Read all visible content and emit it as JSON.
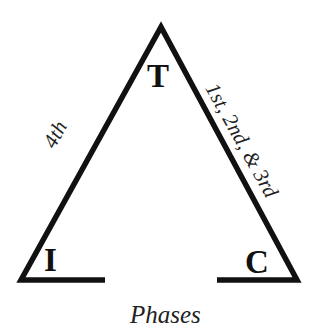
{
  "diagram": {
    "type": "triangle",
    "stroke_color": "#111111",
    "vertices": [
      {
        "id": "top",
        "label": "T"
      },
      {
        "id": "bottom-left",
        "label": "I"
      },
      {
        "id": "bottom-right",
        "label": "C"
      }
    ],
    "edges": [
      {
        "from": "bottom-left",
        "to": "top",
        "label": "4th"
      },
      {
        "from": "top",
        "to": "bottom-right",
        "label": "1st, 2nd, & 3rd"
      }
    ],
    "caption": "Phases"
  }
}
